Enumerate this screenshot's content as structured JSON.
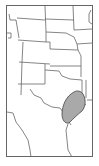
{
  "map": {
    "type": "range-map",
    "region": "Central United States",
    "colors": {
      "background": "#ffffff",
      "border": "#555555",
      "range_fill": "#a9a9a9",
      "range_stroke": "#444444"
    },
    "legend": []
  }
}
